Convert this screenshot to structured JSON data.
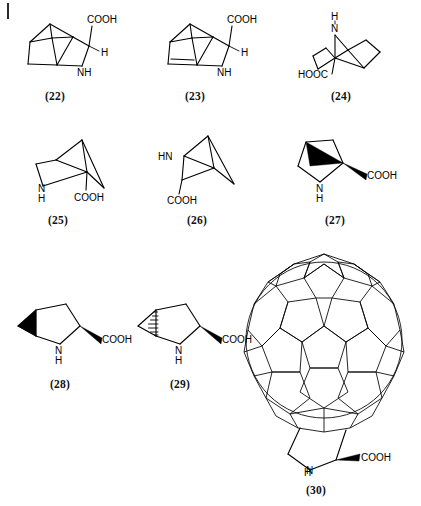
{
  "figure": {
    "kind": "chemical-structure-plate",
    "background_color": "#ffffff",
    "line_color": "#000000",
    "page_tick_present": true,
    "rows": 3,
    "columns": 3
  },
  "compounds": [
    {
      "id": "22",
      "label": "(22)",
      "name": "2-azabicyclo[2.2.2]octane-3-carboxylic acid",
      "skeleton": "bicyclo[2.2.2]octane",
      "atom_labels": [
        "COOH",
        "H",
        "NH"
      ],
      "row": 1,
      "column": 1
    },
    {
      "id": "23",
      "label": "(23)",
      "name": "2-azabicyclo[2.2.2]oct-5-ene-3-carboxylic acid",
      "skeleton": "bicyclo[2.2.2]octene",
      "atom_labels": [
        "COOH",
        "H",
        "NH"
      ],
      "row": 1,
      "column": 2
    },
    {
      "id": "24",
      "label": "(24)",
      "name": "2-azabicyclo[2.2.2]octane-1-carboxylic acid",
      "skeleton": "bicyclo[2.2.2]octane",
      "atom_labels": [
        "H",
        "N",
        "HOOC"
      ],
      "row": 1,
      "column": 3
    },
    {
      "id": "25",
      "label": "(25)",
      "name": "2-azabicyclo[2.1.1]hexane-1-carboxylic acid",
      "skeleton": "bicyclo[2.1.1]hexane",
      "atom_labels": [
        "N",
        "H",
        "COOH"
      ],
      "row": 2,
      "column": 1
    },
    {
      "id": "26",
      "label": "(26)",
      "name": "2-azabicyclo[2.1.1]hexane-3-carboxylic acid",
      "skeleton": "bicyclo[2.1.1]hexane",
      "atom_labels": [
        "HN",
        "COOH"
      ],
      "row": 2,
      "column": 2
    },
    {
      "id": "27",
      "label": "(27)",
      "name": "2-azabicyclo[2.1.0]pentane-carboxylic acid",
      "skeleton": "fused bicyclic pyrrolidine",
      "atom_labels": [
        "N",
        "H",
        "COOH"
      ],
      "bold_wedge": true,
      "row": 2,
      "column": 3
    },
    {
      "id": "28",
      "label": "(28)",
      "name": "cyclopropane-fused proline (bold wedge)",
      "skeleton": "3-azabicyclo[3.1.0]hexane-carboxylic acid",
      "atom_labels": [
        "N",
        "H",
        "COOH"
      ],
      "bold_wedge": true,
      "row": 3,
      "column": 1
    },
    {
      "id": "29",
      "label": "(29)",
      "name": "cyclopropane-fused proline (hashed wedge)",
      "skeleton": "3-azabicyclo[3.1.0]hexane-carboxylic acid",
      "atom_labels": [
        "N",
        "H",
        "COOH"
      ],
      "hashed_wedge": true,
      "row": 3,
      "column": 2
    },
    {
      "id": "30",
      "label": "(30)",
      "name": "fullerene C60-fused pyrrolidine-2-carboxylic acid",
      "skeleton": "fulleroproline",
      "atom_labels": [
        "N",
        "H",
        "COOH"
      ],
      "bold_wedge": true,
      "row": 3,
      "column": 3
    }
  ],
  "atoms": {
    "cooh": "COOH",
    "hooc": "HOOC",
    "nh": "NH",
    "hn": "HN",
    "n": "N",
    "h": "H"
  }
}
